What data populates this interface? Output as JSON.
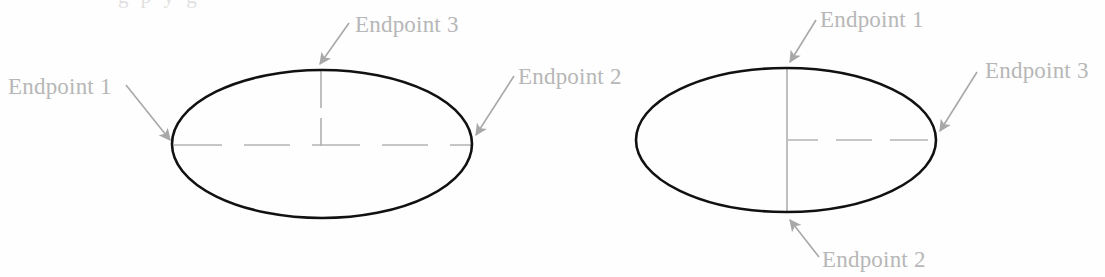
{
  "figure": {
    "type": "line-drawing",
    "clipped_top_text": "g p y g",
    "colors": {
      "ellipse_stroke": "#111111",
      "centerline": "#b0b0b0",
      "label_text": "#b7b7b7",
      "arrow": "#a8a8a8",
      "background": "#fefefe"
    },
    "shapes": [
      {
        "name": "left-ellipse",
        "cx": 322,
        "cy": 144,
        "rx": 150,
        "ry": 74,
        "centerlines": [
          "horizontal-full-dashed",
          "vertical-partial-upper"
        ]
      },
      {
        "name": "right-ellipse",
        "cx": 786,
        "cy": 140,
        "rx": 150,
        "ry": 72,
        "centerlines": [
          "horizontal-right-half-dashed",
          "vertical-full"
        ]
      }
    ],
    "labels": [
      {
        "id": "left-endpoint-1",
        "text": "Endpoint 1",
        "x": 8,
        "y": 75,
        "target_x": 175,
        "target_y": 144
      },
      {
        "id": "left-endpoint-3",
        "text": "Endpoint 3",
        "x": 355,
        "y": 13,
        "target_x": 320,
        "target_y": 70
      },
      {
        "id": "left-endpoint-2",
        "text": "Endpoint 2",
        "x": 518,
        "y": 65,
        "target_x": 474,
        "target_y": 140
      },
      {
        "id": "right-endpoint-1",
        "text": "Endpoint 1",
        "x": 820,
        "y": 8,
        "target_x": 788,
        "target_y": 68
      },
      {
        "id": "right-endpoint-3",
        "text": "Endpoint 3",
        "x": 985,
        "y": 59,
        "target_x": 938,
        "target_y": 137
      },
      {
        "id": "right-endpoint-2",
        "text": "Endpoint 2",
        "x": 822,
        "y": 248,
        "target_x": 789,
        "target_y": 215
      }
    ]
  }
}
